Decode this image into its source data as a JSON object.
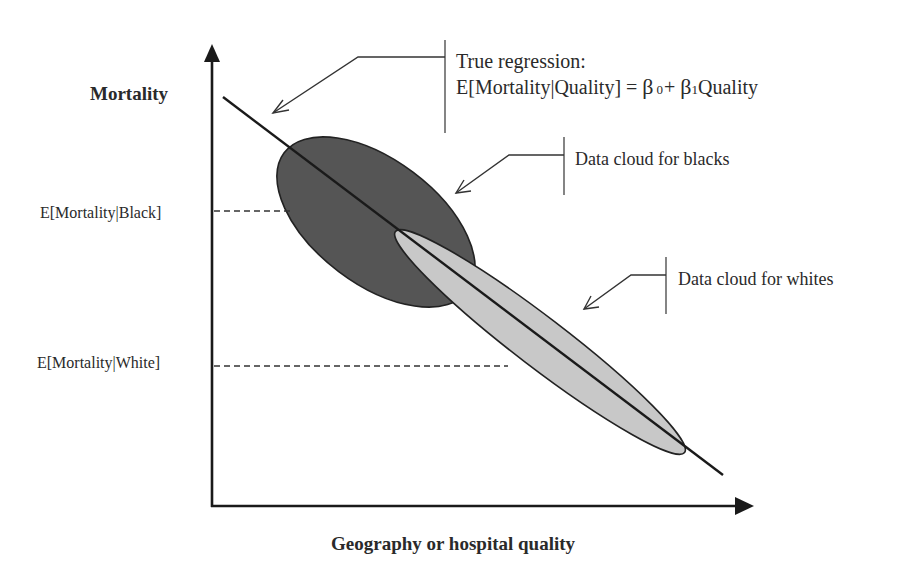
{
  "diagram": {
    "y_axis": {
      "label": "Mortality"
    },
    "x_axis": {
      "label": "Geography or hospital quality"
    },
    "levels": [
      {
        "label": "E[Mortality|Black]",
        "y": 211,
        "dash_end_x": 290
      },
      {
        "label": "E[Mortality|White]",
        "y": 366,
        "dash_end_x": 508
      }
    ],
    "regression_line": {
      "start": [
        223,
        97
      ],
      "end": [
        723,
        475
      ],
      "callout_line1": "True regression:",
      "callout_line2_prefix": "E[Mortality|Quality] = ",
      "beta0": "β",
      "beta0_sub": "0",
      "plus": "+ ",
      "beta1": "β",
      "beta1_sub": "1",
      "quality": "Quality"
    },
    "clouds": [
      {
        "name": "blacks",
        "label": "Data cloud for blacks",
        "fill": "#555555",
        "cx": 376,
        "cy": 222,
        "rx": 115,
        "ry": 62,
        "angle": 37
      },
      {
        "name": "whites",
        "label": "Data cloud for whites",
        "fill": "#c8c8c8",
        "cx": 540,
        "cy": 342,
        "rx": 182,
        "ry": 25,
        "angle": 37.4
      }
    ],
    "colors": {
      "line": "#1a1a1a",
      "text": "#2a2a2a",
      "background": "#ffffff"
    }
  }
}
